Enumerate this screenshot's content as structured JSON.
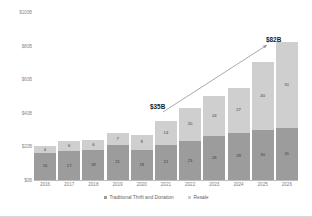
{
  "chart_data": {
    "type": "bar",
    "subtype": "stacked-column",
    "title": "",
    "xlabel": "",
    "ylabel": "",
    "categories": [
      "2016",
      "2017",
      "2018",
      "2019",
      "2020",
      "2021",
      "2022",
      "2023",
      "2024",
      "2025",
      "2026"
    ],
    "series": [
      {
        "name": "Traditional Thrift and Donation",
        "color": "#9c9c9c",
        "values": [
          16,
          17,
          18,
          21,
          18,
          21,
          23,
          26,
          28,
          30,
          31
        ]
      },
      {
        "name": "Resale",
        "color": "#cfcfcf",
        "values": [
          4,
          6,
          6,
          7,
          9,
          14,
          20,
          24,
          27,
          40,
          51
        ]
      }
    ],
    "ylim": [
      0,
      100
    ],
    "yticks": [
      0,
      20,
      40,
      60,
      80,
      100
    ],
    "ytick_labels": [
      "$0B",
      "$20B",
      "$40B",
      "$60B",
      "$80B",
      "$100B"
    ],
    "grid": false,
    "legend_position": "bottom",
    "annotations": [
      {
        "id": "start",
        "text": "$35B",
        "category": "2021"
      },
      {
        "id": "end",
        "text": "$82B",
        "category": "2026"
      }
    ]
  },
  "axis": {
    "y_ticks": [
      "$100B",
      "$80B",
      "$60B",
      "$40B",
      "$20B",
      "$0B"
    ]
  },
  "legend": {
    "items": [
      {
        "label": "Traditional Thrift and Donation"
      },
      {
        "label": "Resale"
      }
    ]
  },
  "callouts": {
    "start": "$35B",
    "end": "$82B"
  }
}
